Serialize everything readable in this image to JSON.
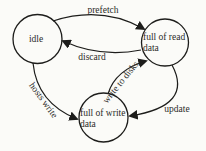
{
  "diagram": {
    "type": "state-diagram",
    "background_color": "#fbfbf8",
    "stroke_color": "#1d1d1b",
    "text_color": "#2b2b28",
    "states": [
      {
        "id": "idle",
        "lines": [
          "idle"
        ]
      },
      {
        "id": "full-of-read-data",
        "lines": [
          "full of read",
          "data"
        ]
      },
      {
        "id": "full-of-write-data",
        "lines": [
          "full of write",
          "data"
        ]
      }
    ],
    "transitions": [
      {
        "id": "prefetch",
        "label": "prefetch",
        "from": "idle",
        "to": "full-of-read-data"
      },
      {
        "id": "discard",
        "label": "discard",
        "from": "full-of-read-data",
        "to": "idle"
      },
      {
        "id": "hosts-write",
        "label": "hosts write",
        "from": "idle",
        "to": "full-of-write-data"
      },
      {
        "id": "write-to-disks",
        "label": "write to disks",
        "from": "full-of-write-data",
        "to": "full-of-read-data"
      },
      {
        "id": "update",
        "label": "update",
        "from": "full-of-read-data",
        "to": "full-of-write-data"
      }
    ]
  }
}
